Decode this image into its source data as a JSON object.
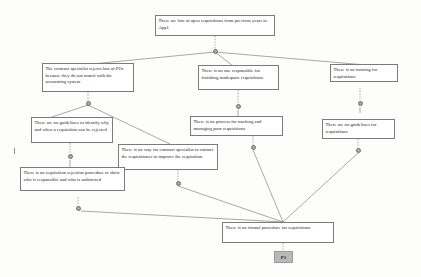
{
  "diagram": {
    "type": "cause-effect-tree",
    "colors": {
      "node_border": "#7b7b7b",
      "node_fill": "#ffffff",
      "edge": "#6e6e6e",
      "junction_fill": "#a9a9a9",
      "badge_fill": "#b9b9b9",
      "background": "#fdfdfc"
    }
  },
  "nodes": {
    "top_effect": "There are lots of open requisitions from previous years in App1",
    "contract_specialist_rejects": "The contract specialist rejects lots of POs because they do not match with the accounting system",
    "no_one_responsible": "There is no one responsible for finishing inadequate requisitions",
    "no_training": "There is no training for requisitions",
    "no_guidelines_identify": "There are no guidelines to identify why and when a requisition can be rejected",
    "no_process_tracking": "There is no process for tracking and managing poor requisitions",
    "no_guidelines_requisitions": "There are no guidelines for requisitions",
    "no_way_contact": "There is no way for contract specialist to contact the requisitioner to improve the requisition",
    "no_rejection_procedure": "There is no requisition rejection procedure to show who is responsible and who is authorised",
    "no_formal_procedure": "There is no formal procedure for requisitions",
    "root_badge": "P1"
  }
}
